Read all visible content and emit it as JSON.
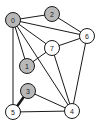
{
  "figure": {
    "background_color": "#ffffff",
    "width": 100,
    "height": 127
  },
  "style": {
    "node_radius": 7.5,
    "filled_color": "#b8b8b8",
    "unfilled_color": "#ffffff",
    "node_stroke_color": "#1a1a1a",
    "edge_color": "#1a1a1a",
    "edge_width": 1,
    "highlight_edge_width": 2.6
  },
  "chart_data": {
    "type": "diagram",
    "diagram_kind": "node-link-graph",
    "directed": false,
    "node_count": 8,
    "edge_count": 12,
    "nodes": [
      {
        "id": "0",
        "label": "0",
        "x": 13,
        "y": 20,
        "fill": "filled"
      },
      {
        "id": "1",
        "label": "1",
        "x": 27,
        "y": 66,
        "fill": "filled"
      },
      {
        "id": "2",
        "label": "2",
        "x": 52,
        "y": 14,
        "fill": "filled"
      },
      {
        "id": "3",
        "label": "3",
        "x": 28,
        "y": 91,
        "fill": "filled"
      },
      {
        "id": "4",
        "label": "4",
        "x": 72,
        "y": 111,
        "fill": "unfilled"
      },
      {
        "id": "5",
        "label": "5",
        "x": 13,
        "y": 112,
        "fill": "unfilled"
      },
      {
        "id": "6",
        "label": "6",
        "x": 87,
        "y": 36,
        "fill": "unfilled"
      },
      {
        "id": "7",
        "label": "7",
        "x": 52,
        "y": 48,
        "fill": "unfilled"
      }
    ],
    "edges": [
      {
        "source": "0",
        "target": "2",
        "weight": 1,
        "highlighted": false
      },
      {
        "source": "0",
        "target": "6",
        "weight": 1,
        "highlighted": false
      },
      {
        "source": "0",
        "target": "7",
        "weight": 1,
        "highlighted": false
      },
      {
        "source": "0",
        "target": "1",
        "weight": 1,
        "highlighted": false
      },
      {
        "source": "0",
        "target": "5",
        "weight": 1,
        "highlighted": false
      },
      {
        "source": "0",
        "target": "4",
        "weight": 1,
        "highlighted": false
      },
      {
        "source": "1",
        "target": "7",
        "weight": 1,
        "highlighted": false
      },
      {
        "source": "2",
        "target": "6",
        "weight": 1,
        "highlighted": false
      },
      {
        "source": "7",
        "target": "6",
        "weight": 1,
        "highlighted": false
      },
      {
        "source": "7",
        "target": "4",
        "weight": 1,
        "highlighted": false
      },
      {
        "source": "6",
        "target": "4",
        "weight": 1,
        "highlighted": false
      },
      {
        "source": "3",
        "target": "4",
        "weight": 1,
        "highlighted": false
      },
      {
        "source": "3",
        "target": "5",
        "weight": 1,
        "highlighted": true
      },
      {
        "source": "5",
        "target": "4",
        "weight": 1,
        "highlighted": false
      }
    ]
  }
}
